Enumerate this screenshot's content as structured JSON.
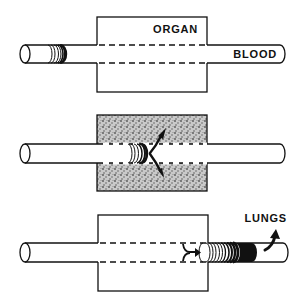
{
  "diagram": {
    "panels": [
      {
        "id": "panel-1",
        "organ_label": "ORGAN",
        "vessel_label": "BLOOD",
        "organ_fill": "plain",
        "description": "Bolus of blood approaching the organ"
      },
      {
        "id": "panel-2",
        "organ_fill": "stippled",
        "description": "Substance diffusing from blood into the organ tissue"
      },
      {
        "id": "panel-3",
        "destination_label": "LUNGS",
        "organ_fill": "plain",
        "description": "Substance returning from organ to blood and carried to the lungs"
      }
    ],
    "colors": {
      "ink": "#111111",
      "background": "#ffffff",
      "stipple": "#8a8a8a"
    }
  }
}
